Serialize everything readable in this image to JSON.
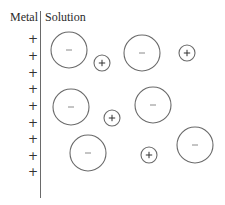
{
  "labels": {
    "metal": "Metal",
    "solution": "Solution"
  },
  "metal_surface": {
    "charge_symbol": "+",
    "x": 33,
    "ys": [
      39,
      56,
      73,
      89,
      106,
      123,
      139,
      156,
      172
    ]
  },
  "ions": {
    "stroke_color": "#6a6a6a",
    "anions": [
      {
        "symbol": "−",
        "cx": 69,
        "cy": 50,
        "r": 18
      },
      {
        "symbol": "−",
        "cx": 142,
        "cy": 53,
        "r": 18
      },
      {
        "symbol": "−",
        "cx": 71,
        "cy": 107,
        "r": 18
      },
      {
        "symbol": "−",
        "cx": 153,
        "cy": 105,
        "r": 18
      },
      {
        "symbol": "−",
        "cx": 88,
        "cy": 153,
        "r": 18
      },
      {
        "symbol": "−",
        "cx": 195,
        "cy": 145,
        "r": 18
      }
    ],
    "cations": [
      {
        "symbol": "+",
        "cx": 102,
        "cy": 63,
        "r": 8
      },
      {
        "symbol": "+",
        "cx": 187,
        "cy": 53,
        "r": 8
      },
      {
        "symbol": "+",
        "cx": 112,
        "cy": 118,
        "r": 8
      },
      {
        "symbol": "+",
        "cx": 149,
        "cy": 155,
        "r": 8
      }
    ]
  }
}
